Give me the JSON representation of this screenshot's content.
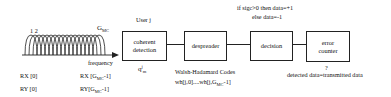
{
  "spectrum": {
    "label_left": "1 2",
    "label_right_main": "G",
    "label_right_sub": "MC",
    "axis_label": "frequency",
    "rx_left": "RX [0]",
    "ry_left": "RY [0]",
    "rx_right_prefix": "RX [G",
    "rx_right_sub": "MC",
    "rx_right_suffix": "-1]",
    "ry_right_prefix": "RY[G",
    "ry_right_sub": "MC",
    "ry_right_suffix": "-1]"
  },
  "blocks": {
    "coherent": {
      "line1": "coherent",
      "line2": "detection",
      "above": "User j",
      "below_main": "q",
      "below_sup": "j",
      "below_sub": "m"
    },
    "despreader": {
      "label": "despreader",
      "below_line1": "Walsh-Hadamard Codes",
      "below_line2_prefix": "wh[j,0]....wh[j,G",
      "below_line2_sub": "MC",
      "below_line2_suffix": "-1]"
    },
    "decision": {
      "label": "decision",
      "above_line1": "if sigc>0 then data=+1",
      "above_line2": "else data=-1"
    },
    "error_counter": {
      "line1": "error",
      "line2": "counter",
      "below_line1": "?",
      "below_line2": "detected data=transmitted data"
    }
  }
}
